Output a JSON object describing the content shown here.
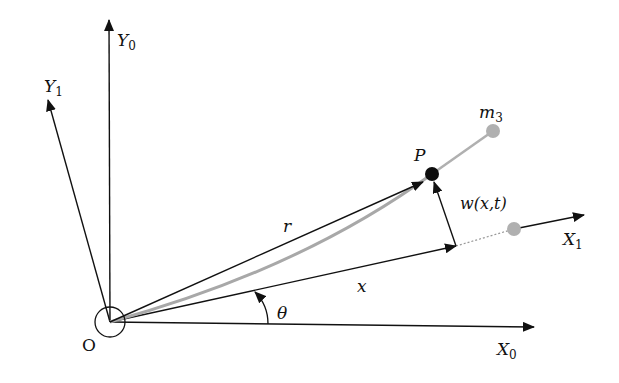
{
  "diagram": {
    "colors": {
      "line": "#111111",
      "beam": "#a8a8a8",
      "point_P": "#0d0d0d",
      "mass": "#b0b0b0"
    },
    "labels": {
      "origin": "O",
      "y0": "Y",
      "y0_sub": "0",
      "y1": "Y",
      "y1_sub": "1",
      "x0": "X",
      "x0_sub": "0",
      "x1": "X",
      "x1_sub": "1",
      "r": "r",
      "x": "x",
      "theta": "θ",
      "w": "w(x,t)",
      "P": "P",
      "m3": "m",
      "m3_sub": "3"
    },
    "elements": [
      {
        "name": "fixed-frame-X0-axis",
        "type": "arrow",
        "from": [
          110,
          322
        ],
        "to": [
          534,
          327
        ]
      },
      {
        "name": "fixed-frame-Y0-axis",
        "type": "arrow",
        "from": [
          110,
          322
        ],
        "to": [
          109,
          20
        ]
      },
      {
        "name": "rotating-frame-X1-axis",
        "type": "arrow",
        "from": [
          110,
          322
        ],
        "to": [
          584,
          215
        ]
      },
      {
        "name": "rotating-frame-Y1-axis",
        "type": "arrow",
        "from": [
          110,
          322
        ],
        "to": [
          48,
          100
        ]
      },
      {
        "name": "position-vector-r",
        "type": "arrow",
        "from": [
          110,
          322
        ],
        "to": [
          423,
          182
        ]
      },
      {
        "name": "axial-coordinate-x",
        "type": "arrow",
        "from": [
          110,
          322
        ],
        "to": [
          456,
          246
        ]
      },
      {
        "name": "deflection-w",
        "type": "arrow",
        "from": [
          456,
          246
        ],
        "to": [
          434,
          180
        ]
      },
      {
        "name": "hub-circle",
        "type": "circle",
        "center": [
          110,
          322
        ],
        "r": 15
      },
      {
        "name": "point-P",
        "type": "dot",
        "center": [
          432,
          174
        ],
        "r": 7
      },
      {
        "name": "tip-mass-m3",
        "type": "dot",
        "center": [
          493,
          131
        ],
        "r": 7
      },
      {
        "name": "undeformed-mass",
        "type": "dot",
        "center": [
          514,
          229
        ],
        "r": 7
      }
    ]
  }
}
